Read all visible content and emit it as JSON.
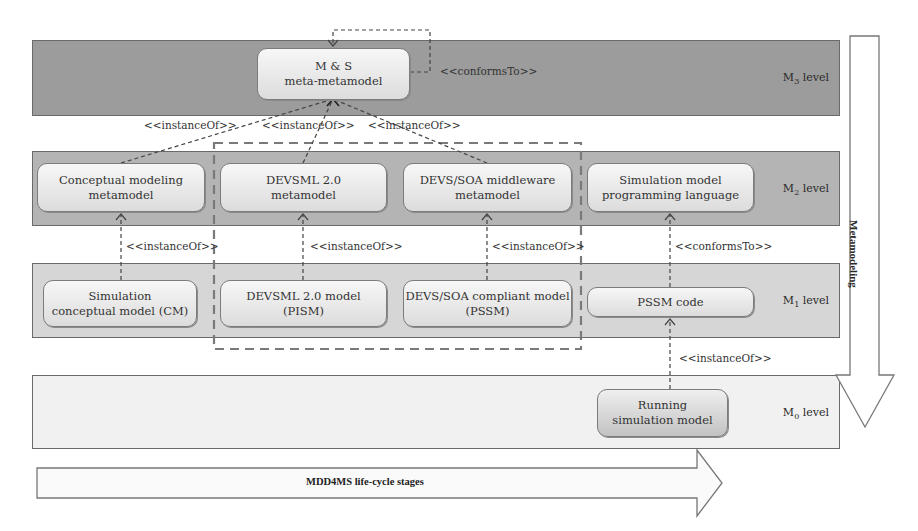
{
  "caption_partial": "...p...     ...g...",
  "levels": {
    "m3": {
      "prefix": "M",
      "sub": "3",
      "suffix": " level"
    },
    "m2": {
      "prefix": "M",
      "sub": "2",
      "suffix": " level"
    },
    "m1": {
      "prefix": "M",
      "sub": "1",
      "suffix": " level"
    },
    "m0": {
      "prefix": "M",
      "sub": "0",
      "suffix": " level"
    }
  },
  "nodes": {
    "ms_meta_metamodel": "M & S\nmeta-metamodel",
    "conceptual_metamodel": "Conceptual modeling\nmetamodel",
    "devsml_metamodel": "DEVSML 2.0\nmetamodel",
    "devssoa_metamodel": "DEVS/SOA middleware\nmetamodel",
    "sim_prog_language": "Simulation model\nprogramming language",
    "sim_conceptual_model": "Simulation\nconceptual model (CM)",
    "devsml_model": "DEVSML 2.0 model\n(PISM)",
    "devssoa_model": "DEVS/SOA compliant model\n(PSSM)",
    "pssm_code": "PSSM code",
    "running_model": "Running\nsimulation model"
  },
  "relations": {
    "conforms_to": "<<conformsTo>>",
    "instance_of": "<<instanceOf>>"
  },
  "arrows": {
    "metamodeling": "Metamodeling",
    "lifecycle": "MDD4MS life-cycle stages"
  },
  "colors": {
    "m3_band": "#9c9c9c",
    "m2_band": "#b4b4b4",
    "m1_band": "#d6d6d6",
    "m0_band": "#f1f1f1",
    "border": "#6a6a6a",
    "dashed_group": "#7a7a7a"
  }
}
